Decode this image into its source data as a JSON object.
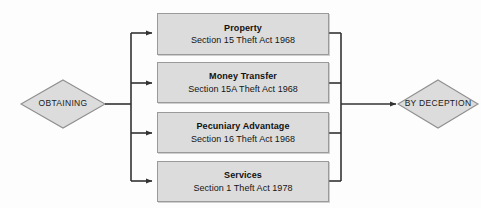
{
  "diagram": {
    "type": "flowchart",
    "title": "Obtaining by Deception",
    "background_color": "#fdfdfd",
    "node_fill_color": "#dcdcdc",
    "node_border_color": "#9a9a9a",
    "line_color": "#333333",
    "start_node": {
      "shape": "diamond",
      "label": "OBTAINING"
    },
    "end_node": {
      "shape": "diamond",
      "label": "BY DECEPTION"
    },
    "branches": [
      {
        "title": "Property",
        "subtitle": "Section 15 Theft Act 1968"
      },
      {
        "title": "Money Transfer",
        "subtitle": "Section 15A Theft Act 1968"
      },
      {
        "title": "Pecuniary Advantage",
        "subtitle": "Section 16 Theft Act 1968"
      },
      {
        "title": "Services",
        "subtitle": "Section 1 Theft Act 1978"
      }
    ]
  }
}
